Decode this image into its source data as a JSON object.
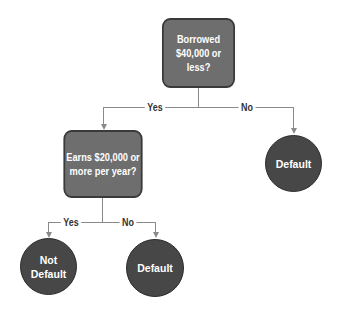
{
  "diagram": {
    "root": {
      "label": "Borrowed\n$40,000 or less?"
    },
    "root_edges": {
      "yes": "Yes",
      "no": "No"
    },
    "yes_node": {
      "label": "Earns $20,000 or\nmore per year?"
    },
    "no_leaf": {
      "label": "Default"
    },
    "sub_edges": {
      "yes": "Yes",
      "no": "No"
    },
    "sub_yes_leaf": {
      "label": "Not\nDefault"
    },
    "sub_no_leaf": {
      "label": "Default"
    }
  },
  "colors": {
    "box": "#6e6e6e",
    "circle": "#474747",
    "line": "#8a8a8a"
  }
}
